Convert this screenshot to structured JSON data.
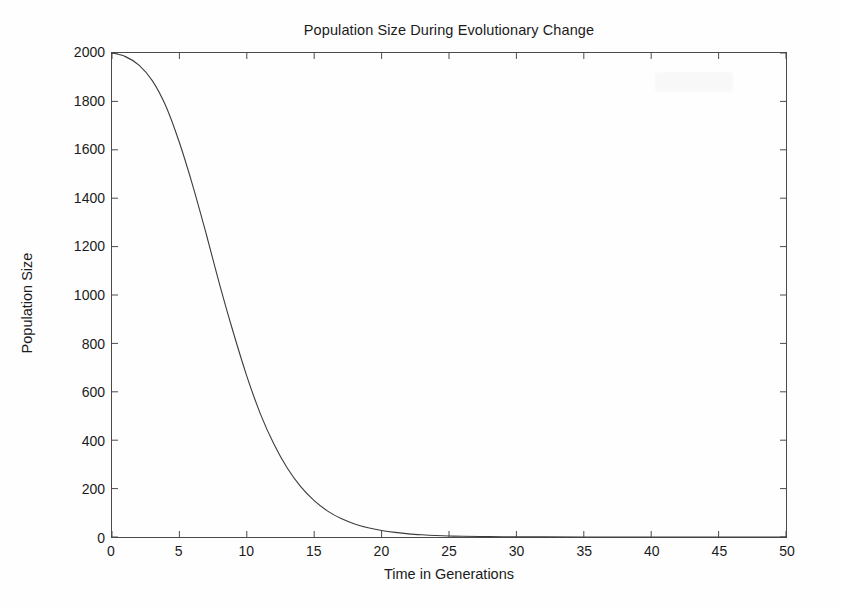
{
  "chart_data": {
    "type": "line",
    "title": "Population Size During Evolutionary Change",
    "xlabel": "Time in Generations",
    "ylabel": "Population Size",
    "xlim": [
      0,
      50
    ],
    "ylim": [
      0,
      2000
    ],
    "xticks": [
      0,
      5,
      10,
      15,
      20,
      25,
      30,
      35,
      40,
      45,
      50
    ],
    "yticks": [
      0,
      200,
      400,
      600,
      800,
      1000,
      1200,
      1400,
      1600,
      1800,
      2000
    ],
    "grid": false,
    "legend": false,
    "line_color": "#3c3c3c",
    "line_width": 1.1,
    "series": [
      {
        "name": "Population Size",
        "x": [
          0,
          1,
          2,
          3,
          4,
          5,
          6,
          7,
          8,
          9,
          10,
          11,
          12,
          13,
          14,
          15,
          16,
          17,
          18,
          19,
          20,
          21,
          22,
          23,
          24,
          25,
          26,
          28,
          30,
          32,
          35,
          40,
          45,
          50
        ],
        "values": [
          2000,
          1985,
          1950,
          1885,
          1780,
          1630,
          1450,
          1250,
          1040,
          845,
          665,
          510,
          385,
          285,
          208,
          150,
          107,
          76,
          54,
          38,
          27,
          19,
          13,
          9,
          6,
          4,
          3,
          1.5,
          0.7,
          0.4,
          0.15,
          0.02,
          0,
          0
        ]
      }
    ]
  },
  "figure": {
    "title": "Population Size During Evolutionary Change",
    "xlabel": "Time in Generations",
    "ylabel": "Population Size"
  }
}
